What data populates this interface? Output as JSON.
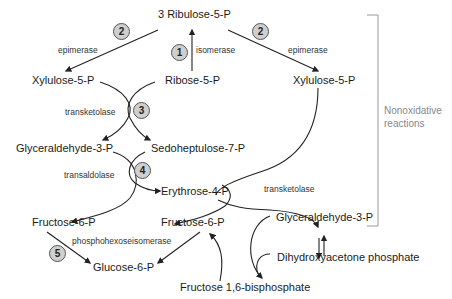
{
  "diagram": {
    "nodes": {
      "ribulose": "3 Ribulose-5-P",
      "xylulose_left": "Xylulose-5-P",
      "ribose": "Ribose-5-P",
      "xylulose_right": "Xylulose-5-P",
      "glyceraldehyde_left": "Glyceraldehyde-3-P",
      "sedoheptulose": "Sedoheptulose-7-P",
      "erythrose": "Erythrose-4-P",
      "fructose_left": "Fructose-6-P",
      "fructose_center": "Fructose-6-P",
      "glyceraldehyde_right": "Glyceraldehyde-3-P",
      "dihydroxyacetone": "Dihydroxyacetone phosphate",
      "glucose": "Glucose-6-P",
      "fructose_bisphosphate": "Fructose 1,6-bisphosphate"
    },
    "enzymes": {
      "epimerase_left": "epimerase",
      "isomerase": "isomerase",
      "epimerase_right": "epimerase",
      "transketolase_1": "transketolase",
      "transaldolase": "transaldolase",
      "transketolase_2": "transketolase",
      "phosphohexoseisomerase": "phosphohexoseisomerase"
    },
    "steps": [
      "1",
      "2",
      "2",
      "3",
      "4",
      "5"
    ],
    "bracket_label_line1": "Nonoxidative",
    "bracket_label_line2": "reactions"
  },
  "colors": {
    "arrow": "#222222",
    "badge_fill": "#cfcfcf",
    "badge_stroke": "#555555",
    "bracket": "#999999",
    "bracket_text": "#888888"
  }
}
